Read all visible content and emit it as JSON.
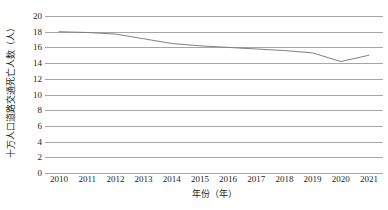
{
  "chart_data": {
    "type": "line",
    "title": "",
    "subtitle": "",
    "xlabel": "年份（年）",
    "ylabel": "十万人口道路交通死亡人数（人）",
    "categories": [
      "2010",
      "2011",
      "2012",
      "2013",
      "2014",
      "2015",
      "2016",
      "2017",
      "2018",
      "2019",
      "2020",
      "2021"
    ],
    "x": [
      2010,
      2011,
      2012,
      2013,
      2014,
      2015,
      2016,
      2017,
      2018,
      2019,
      2020,
      2021
    ],
    "values": [
      18.0,
      17.9,
      17.7,
      17.1,
      16.5,
      16.2,
      16.0,
      15.8,
      15.6,
      15.3,
      14.2,
      15.0
    ],
    "series": [
      {
        "name": "十万人口道路交通死亡人数",
        "values": [
          18.0,
          17.9,
          17.7,
          17.1,
          16.5,
          16.2,
          16.0,
          15.8,
          15.6,
          15.3,
          14.2,
          15.0
        ],
        "color": "#808080"
      }
    ],
    "ylim": [
      0,
      20
    ],
    "ytick_step": 2,
    "yticks": [
      20,
      18,
      16,
      14,
      12,
      10,
      8,
      6,
      4,
      2,
      0
    ],
    "ytick_labels": [
      "20",
      "18",
      "16",
      "14",
      "12",
      "10",
      "8",
      "6",
      "4",
      "2",
      "0"
    ],
    "grid": "horizontal",
    "grid_color": "#a6a6a6",
    "legend": "none",
    "legend_position": "",
    "background_color": "#ffffff",
    "markers": "none",
    "line_width": 1,
    "axis_border": "none",
    "annotations": []
  }
}
